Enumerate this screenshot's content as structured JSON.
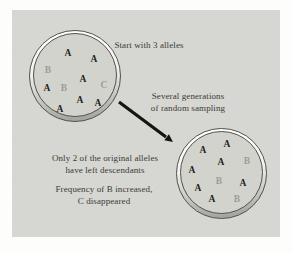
{
  "labels": {
    "start": "Start with 3 alleles",
    "sampling": {
      "lines": [
        "Several generations",
        "of random sampling"
      ]
    },
    "result1": {
      "lines": [
        "Only 2 of the original alleles",
        "have left descendants"
      ]
    },
    "result2": {
      "lines": [
        "Frequency of B increased,",
        "C disappeared"
      ]
    }
  },
  "populations": {
    "before": {
      "alleles": [
        {
          "letter": "A",
          "x": 34,
          "y": 20,
          "shade": "black"
        },
        {
          "letter": "A",
          "x": 60,
          "y": 26,
          "shade": "black"
        },
        {
          "letter": "B",
          "x": 14,
          "y": 37,
          "shade": "gray"
        },
        {
          "letter": "A",
          "x": 49,
          "y": 46,
          "shade": "black"
        },
        {
          "letter": "A",
          "x": 13,
          "y": 55,
          "shade": "black"
        },
        {
          "letter": "B",
          "x": 30,
          "y": 55,
          "shade": "gray"
        },
        {
          "letter": "C",
          "x": 70,
          "y": 52,
          "shade": "gray"
        },
        {
          "letter": "A",
          "x": 46,
          "y": 67,
          "shade": "black"
        },
        {
          "letter": "A",
          "x": 64,
          "y": 70,
          "shade": "black"
        },
        {
          "letter": "A",
          "x": 26,
          "y": 76,
          "shade": "black"
        }
      ]
    },
    "after": {
      "alleles": [
        {
          "letter": "A",
          "x": 46,
          "y": 13,
          "shade": "black"
        },
        {
          "letter": "A",
          "x": 22,
          "y": 19,
          "shade": "black"
        },
        {
          "letter": "A",
          "x": 40,
          "y": 31,
          "shade": "black"
        },
        {
          "letter": "B",
          "x": 66,
          "y": 30,
          "shade": "gray"
        },
        {
          "letter": "A",
          "x": 11,
          "y": 39,
          "shade": "black"
        },
        {
          "letter": "B",
          "x": 38,
          "y": 50,
          "shade": "gray"
        },
        {
          "letter": "A",
          "x": 62,
          "y": 52,
          "shade": "black"
        },
        {
          "letter": "A",
          "x": 17,
          "y": 57,
          "shade": "black"
        },
        {
          "letter": "A",
          "x": 31,
          "y": 68,
          "shade": "black"
        },
        {
          "letter": "B",
          "x": 56,
          "y": 68,
          "shade": "gray"
        }
      ]
    }
  },
  "colors": {
    "page": "#fdfdfc",
    "panel": "#d8d8d4",
    "dish_fill": "#d3d3ce",
    "rim_shadow": "#a6a6a0",
    "ring_stroke": "#55504a",
    "allele_black": "#1f1f1d",
    "allele_gray": "#9c9c97",
    "text": "#3b3b35",
    "arrow": "#141414"
  }
}
